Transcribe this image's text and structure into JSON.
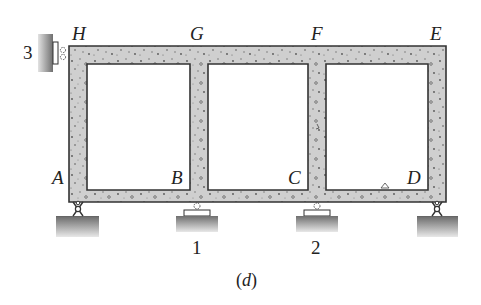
{
  "figure": {
    "caption_open": "(",
    "caption_letter": "d",
    "caption_close": ")",
    "colors": {
      "concrete_fill": "#cfcfcf",
      "outline": "#333333",
      "ground_top": "#777777",
      "ground_bottom": "#e6e6e6",
      "text": "#222222"
    }
  },
  "nodes": {
    "H": "H",
    "G": "G",
    "F": "F",
    "E": "E",
    "A": "A",
    "B": "B",
    "C": "C",
    "D": "D"
  },
  "supports": {
    "wall_label": "3",
    "support1_label": "1",
    "support2_label": "2"
  }
}
